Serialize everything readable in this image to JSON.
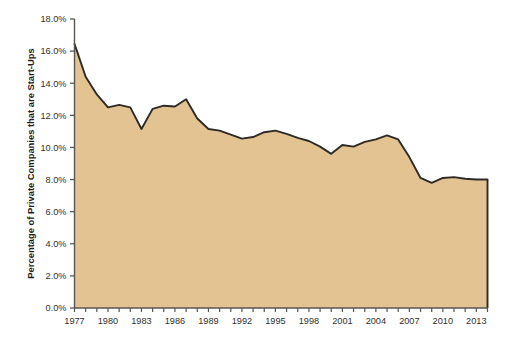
{
  "chart_data": {
    "type": "area",
    "title": "",
    "xlabel": "",
    "ylabel": "Percentage of Private Companies that are Start-Ups",
    "xlim": [
      1977,
      2014
    ],
    "ylim": [
      0.0,
      18.0
    ],
    "grid": false,
    "legend": false,
    "series_name": "Percentage of Private Companies that are Start-Ups",
    "fill_color": "#e3c392",
    "line_color": "#2e2a26",
    "axis_color": "#5a554f",
    "background_color": "#ffffff",
    "y_ticks": [
      "0.0%",
      "2.0%",
      "4.0%",
      "6.0%",
      "8.0%",
      "10.0%",
      "12.0%",
      "14.0%",
      "16.0%",
      "18.0%"
    ],
    "y_tick_values": [
      0.0,
      2.0,
      4.0,
      6.0,
      8.0,
      10.0,
      12.0,
      14.0,
      16.0,
      18.0
    ],
    "x_ticks": [
      "1977",
      "1980",
      "1983",
      "1986",
      "1989",
      "1992",
      "1995",
      "1998",
      "2001",
      "2004",
      "2007",
      "2010",
      "2013"
    ],
    "x_tick_values": [
      1977,
      1980,
      1983,
      1986,
      1989,
      1992,
      1995,
      1998,
      2001,
      2004,
      2007,
      2010,
      2013
    ],
    "x_minor_tick_values": [
      1977,
      1978,
      1979,
      1980,
      1981,
      1982,
      1983,
      1984,
      1985,
      1986,
      1987,
      1988,
      1989,
      1990,
      1991,
      1992,
      1993,
      1994,
      1995,
      1996,
      1997,
      1998,
      1999,
      2000,
      2001,
      2002,
      2003,
      2004,
      2005,
      2006,
      2007,
      2008,
      2009,
      2010,
      2011,
      2012,
      2013,
      2014
    ],
    "x": [
      1977,
      1978,
      1979,
      1980,
      1981,
      1982,
      1983,
      1984,
      1985,
      1986,
      1987,
      1988,
      1989,
      1990,
      1991,
      1992,
      1993,
      1994,
      1995,
      1996,
      1997,
      1998,
      1999,
      2000,
      2001,
      2002,
      2003,
      2004,
      2005,
      2006,
      2007,
      2008,
      2009,
      2010,
      2011,
      2012,
      2013,
      2014
    ],
    "values": [
      16.45,
      14.4,
      13.3,
      12.5,
      12.65,
      12.5,
      11.15,
      12.4,
      12.6,
      12.55,
      13.0,
      11.8,
      11.15,
      11.05,
      10.8,
      10.55,
      10.65,
      10.95,
      11.05,
      10.85,
      10.6,
      10.4,
      10.05,
      9.6,
      10.15,
      10.05,
      10.35,
      10.5,
      10.75,
      10.5,
      9.4,
      8.1,
      7.8,
      8.1,
      8.15,
      8.05,
      8.0,
      8.0
    ]
  },
  "axis": {
    "y_title": "Percentage of Private Companies that are Start-Ups"
  }
}
